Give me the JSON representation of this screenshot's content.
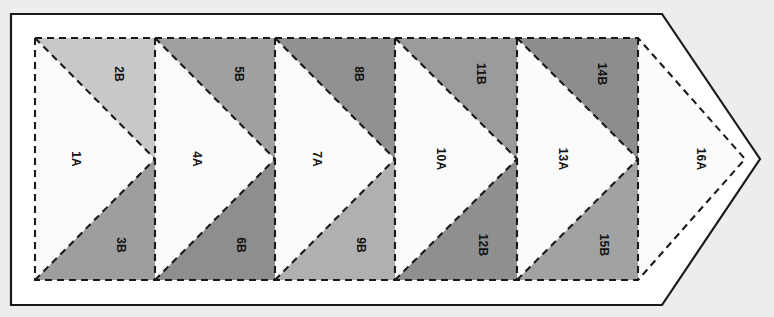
{
  "document": {
    "title": "Flying Geese Paper Piecing Foundation Pattern",
    "type": "quilting-block-diagram",
    "orientation": "landscape",
    "label_rotation_degrees": 90
  },
  "canvas": {
    "width": 774,
    "height": 317,
    "page_background": "#ededed",
    "sheet_fill": "#ffffff"
  },
  "colors": {
    "outline_solid": "#1a1a1a",
    "seam_dashed": "#1a1a1a",
    "fill_a_white": "#fbfbfb",
    "fill_2b": "#c8c8c8",
    "fill_3b": "#9e9e9e",
    "fill_5b": "#a0a0a0",
    "fill_6b": "#8e8e8e",
    "fill_8b": "#919191",
    "fill_9b": "#b0b0b0",
    "fill_11b": "#9b9b9b",
    "fill_12b": "#8f8f8f",
    "fill_14b": "#8d8d8d",
    "fill_15b": "#a2a2a2"
  },
  "geometry": {
    "cutting_line_note": "solid outer pennant outline",
    "seam_line_note": "dashed inner stitching line",
    "column_dividers_x": [
      35,
      155,
      275,
      395,
      517,
      638
    ],
    "seam_top_y": 38,
    "seam_bottom_y": 280,
    "center_y": 159,
    "outer_left_x": 11,
    "outer_top_y": 14,
    "outer_bottom_y": 305,
    "outer_shoulder_x": 662,
    "outer_tip_x": 760,
    "seam_tip_x": 745
  },
  "units": [
    {
      "id": "u1",
      "column": 1,
      "center_label": "1A",
      "top_label": "2B",
      "bottom_label": "3B",
      "center_fill": "#fbfbfb",
      "top_fill": "#c8c8c8",
      "bottom_fill": "#9e9e9e",
      "x_left": 35,
      "x_right": 155
    },
    {
      "id": "u2",
      "column": 2,
      "center_label": "4A",
      "top_label": "5B",
      "bottom_label": "6B",
      "center_fill": "#fbfbfb",
      "top_fill": "#a0a0a0",
      "bottom_fill": "#8e8e8e",
      "x_left": 155,
      "x_right": 275
    },
    {
      "id": "u3",
      "column": 3,
      "center_label": "7A",
      "top_label": "8B",
      "bottom_label": "9B",
      "center_fill": "#fbfbfb",
      "top_fill": "#919191",
      "bottom_fill": "#b0b0b0",
      "x_left": 275,
      "x_right": 395
    },
    {
      "id": "u4",
      "column": 4,
      "center_label": "10A",
      "top_label": "11B",
      "bottom_label": "12B",
      "center_fill": "#fbfbfb",
      "top_fill": "#9b9b9b",
      "bottom_fill": "#8f8f8f",
      "x_left": 395,
      "x_right": 517
    },
    {
      "id": "u5",
      "column": 5,
      "center_label": "13A",
      "top_label": "14B",
      "bottom_label": "15B",
      "center_fill": "#fbfbfb",
      "top_fill": "#8d8d8d",
      "bottom_fill": "#a2a2a2",
      "x_left": 517,
      "x_right": 638
    }
  ],
  "tip_unit": {
    "id": "u6",
    "center_label": "16A",
    "center_fill": "#fbfbfb",
    "label_x": 700,
    "label_y": 159
  }
}
